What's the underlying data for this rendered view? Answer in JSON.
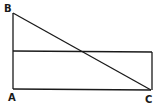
{
  "diagram": {
    "type": "geometry",
    "points": {
      "A": {
        "label": "A",
        "x": 13,
        "y": 89
      },
      "B": {
        "label": "B",
        "x": 13,
        "y": 13
      },
      "C": {
        "label": "C",
        "x": 151,
        "y": 90
      }
    },
    "rectangle": {
      "x1": 13,
      "y1": 51,
      "x2": 151,
      "y2": 90
    },
    "segments": [
      "AB",
      "BC",
      "AC"
    ],
    "colors": {
      "stroke": "#1a1a1a",
      "background": "#ffffff"
    }
  }
}
